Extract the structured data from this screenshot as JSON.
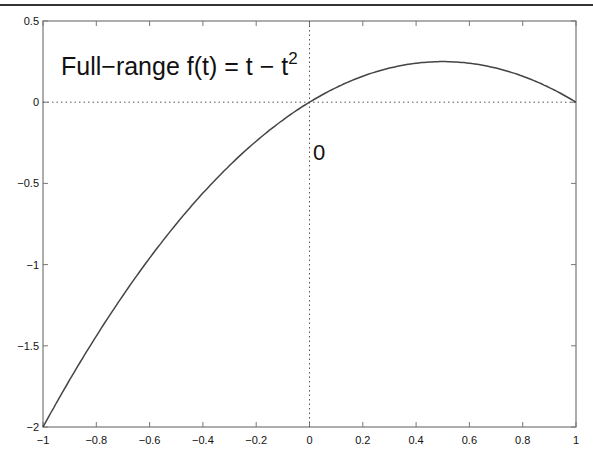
{
  "chart_data": {
    "type": "line",
    "title": "",
    "annotation": "Full-range f(t) = t - t^2",
    "annotation_main": "Full−range f(t) = t − t",
    "annotation_sup": "2",
    "origin_label": "0",
    "xlabel": "",
    "ylabel": "",
    "xlim": [
      -1,
      1
    ],
    "ylim": [
      -2,
      0.5
    ],
    "xticks": [
      "-1",
      "-0.8",
      "-0.6",
      "-0.4",
      "-0.2",
      "0",
      "0.2",
      "0.4",
      "0.6",
      "0.8",
      "1"
    ],
    "yticks": [
      "0.5",
      "0",
      "-0.5",
      "-1",
      "-1.5",
      "-2"
    ],
    "grid": false,
    "reference_lines": {
      "x": 0,
      "y": 0,
      "style": "dotted"
    },
    "series": [
      {
        "name": "f(t) = t - t^2",
        "x": [
          -1,
          -0.8,
          -0.6,
          -0.4,
          -0.2,
          0,
          0.2,
          0.4,
          0.5,
          0.6,
          0.8,
          1
        ],
        "values": [
          -2,
          -1.44,
          -0.96,
          -0.56,
          -0.24,
          0,
          0.16,
          0.24,
          0.25,
          0.24,
          0.16,
          0
        ]
      }
    ],
    "colors": {
      "line": "#444444",
      "axes": "#666666"
    }
  }
}
